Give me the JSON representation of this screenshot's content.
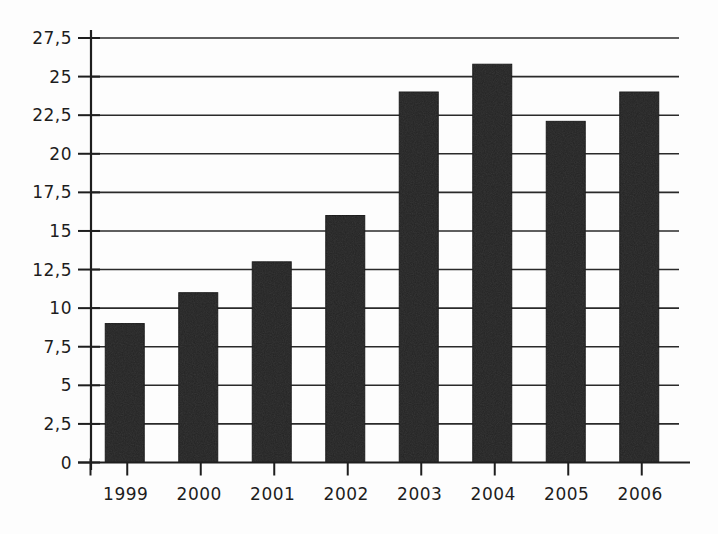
{
  "chart_data": {
    "type": "bar",
    "title": "",
    "subtitle": "",
    "xlabel": "",
    "ylabel": "",
    "categories": [
      "1999",
      "2000",
      "2001",
      "2002",
      "2003",
      "2004",
      "2005",
      "2006"
    ],
    "values": [
      9,
      11,
      13,
      16,
      24,
      25.8,
      22.1,
      24
    ],
    "series": [
      {
        "name": "",
        "values": [
          9,
          11,
          13,
          16,
          24,
          25.8,
          22.1,
          24
        ]
      }
    ],
    "ylim": [
      0,
      27.5
    ],
    "ytick_values": [
      0,
      2.5,
      5,
      7.5,
      10,
      12.5,
      15,
      17.5,
      20,
      22.5,
      25,
      27.5
    ],
    "ytick_labels": [
      "0",
      "2,5",
      "5",
      "7,5",
      "10",
      "12,5",
      "15",
      "17,5",
      "20",
      "22,5",
      "25",
      "27,5"
    ],
    "decimal_separator": ",",
    "grid": true,
    "grid_axis": "y",
    "legend": false,
    "legend_position": "none",
    "bar_color": "#242424",
    "grid_color": "#2a2a2a",
    "axis_color": "#1e1e1e",
    "background_color": "#fdfdfd",
    "annotations": []
  }
}
